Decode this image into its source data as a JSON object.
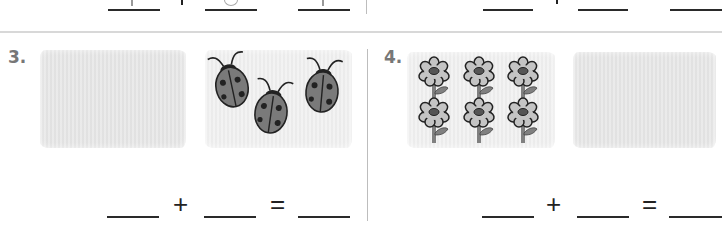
{
  "previous_row": {
    "left_equation": {
      "blank1_glyph": "1",
      "operator": "+",
      "blank2_glyph": "0",
      "blank3_glyph": "1"
    },
    "right_equation": {
      "operator": "+"
    }
  },
  "problems": [
    {
      "number": "3.",
      "left_box": {
        "content": "empty"
      },
      "right_box": {
        "content": "ladybugs",
        "count": 3
      },
      "equation": {
        "plus": "+",
        "equals": "="
      }
    },
    {
      "number": "4.",
      "left_box": {
        "content": "flowers",
        "count": 6
      },
      "right_box": {
        "content": "empty"
      },
      "equation": {
        "plus": "+",
        "equals": "="
      }
    }
  ],
  "colors": {
    "box_fill": "#e6e6e6",
    "label": "#777777",
    "ladybug_body": "#7a7a7a",
    "flower_petal": "#bdbdbd",
    "stem": "#808080",
    "divider": "#d8d8d8"
  }
}
